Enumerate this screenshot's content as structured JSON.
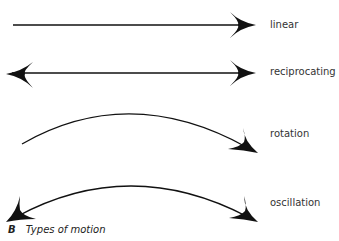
{
  "diagram": {
    "caption_letter": "B",
    "caption_text": "Types of motion",
    "rows": [
      {
        "id": "linear",
        "label": "linear",
        "shape": "straight-arrow",
        "heads": [
          "right"
        ]
      },
      {
        "id": "reciprocating",
        "label": "reciprocating",
        "shape": "straight-arrow",
        "heads": [
          "left",
          "right"
        ]
      },
      {
        "id": "rotation",
        "label": "rotation",
        "shape": "curved-arrow",
        "heads": [
          "right"
        ]
      },
      {
        "id": "oscillation",
        "label": "oscillation",
        "shape": "curved-arrow",
        "heads": [
          "left",
          "right"
        ]
      }
    ],
    "colors": {
      "stroke": "#111111",
      "text": "#333333",
      "background": "#ffffff"
    }
  }
}
